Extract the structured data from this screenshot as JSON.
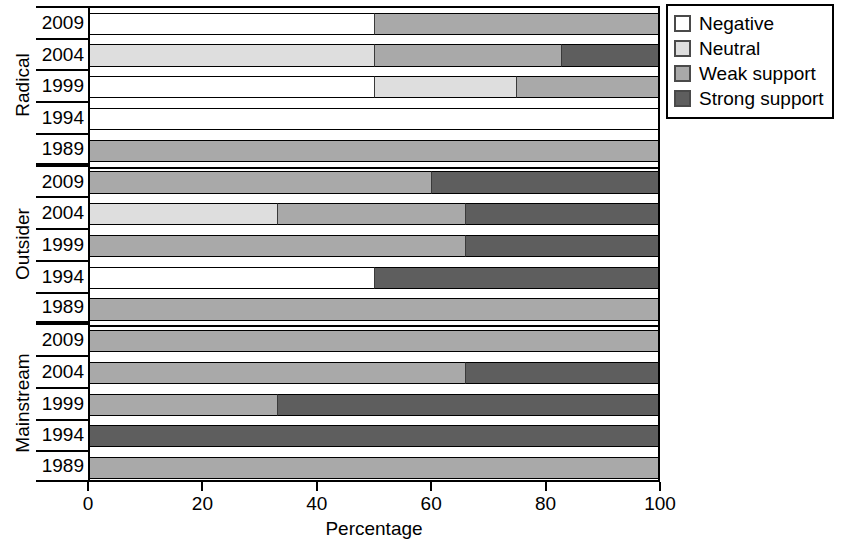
{
  "chart_data": {
    "type": "bar",
    "orientation": "horizontal",
    "stacked": true,
    "stack_mode": "percent",
    "title": "",
    "xlabel": "Percentage",
    "ylabel": "",
    "xlim": [
      0,
      100
    ],
    "xticks": [
      0,
      20,
      40,
      60,
      80,
      100
    ],
    "xticklabels": [
      "0",
      "20",
      "40",
      "60",
      "80",
      "100"
    ],
    "grid": false,
    "legend_position": "top-right",
    "series": [
      {
        "name": "Negative",
        "color": "#ffffff"
      },
      {
        "name": "Neutral",
        "color": "#dedede"
      },
      {
        "name": "Weak support",
        "color": "#a9a9a9"
      },
      {
        "name": "Strong support",
        "color": "#5e5e5e"
      }
    ],
    "groups": [
      {
        "name": "Radical",
        "categories": [
          "2009",
          "2004",
          "1999",
          "1994",
          "1989"
        ],
        "rows": [
          {
            "category": "2009",
            "values": {
              "Negative": 50,
              "Neutral": 0,
              "Weak support": 50,
              "Strong support": 0
            }
          },
          {
            "category": "2004",
            "values": {
              "Negative": 0,
              "Neutral": 50,
              "Weak support": 33,
              "Strong support": 17
            }
          },
          {
            "category": "1999",
            "values": {
              "Negative": 50,
              "Neutral": 25,
              "Weak support": 25,
              "Strong support": 0
            }
          },
          {
            "category": "1994",
            "values": {
              "Negative": 100,
              "Neutral": 0,
              "Weak support": 0,
              "Strong support": 0
            }
          },
          {
            "category": "1989",
            "values": {
              "Negative": 0,
              "Neutral": 0,
              "Weak support": 100,
              "Strong support": 0
            }
          }
        ]
      },
      {
        "name": "Outsider",
        "categories": [
          "2009",
          "2004",
          "1999",
          "1994",
          "1989"
        ],
        "rows": [
          {
            "category": "2009",
            "values": {
              "Negative": 0,
              "Neutral": 0,
              "Weak support": 60,
              "Strong support": 40
            }
          },
          {
            "category": "2004",
            "values": {
              "Negative": 0,
              "Neutral": 33,
              "Weak support": 33,
              "Strong support": 34
            }
          },
          {
            "category": "1999",
            "values": {
              "Negative": 0,
              "Neutral": 0,
              "Weak support": 66,
              "Strong support": 34
            }
          },
          {
            "category": "1994",
            "values": {
              "Negative": 50,
              "Neutral": 0,
              "Weak support": 0,
              "Strong support": 50
            }
          },
          {
            "category": "1989",
            "values": {
              "Negative": 0,
              "Neutral": 0,
              "Weak support": 100,
              "Strong support": 0
            }
          }
        ]
      },
      {
        "name": "Mainstream",
        "categories": [
          "2009",
          "2004",
          "1999",
          "1994",
          "1989"
        ],
        "rows": [
          {
            "category": "2009",
            "values": {
              "Negative": 0,
              "Neutral": 0,
              "Weak support": 100,
              "Strong support": 0
            }
          },
          {
            "category": "2004",
            "values": {
              "Negative": 0,
              "Neutral": 0,
              "Weak support": 66,
              "Strong support": 34
            }
          },
          {
            "category": "1999",
            "values": {
              "Negative": 0,
              "Neutral": 0,
              "Weak support": 33,
              "Strong support": 67
            }
          },
          {
            "category": "1994",
            "values": {
              "Negative": 0,
              "Neutral": 0,
              "Weak support": 0,
              "Strong support": 100
            }
          },
          {
            "category": "1989",
            "values": {
              "Negative": 0,
              "Neutral": 0,
              "Weak support": 100,
              "Strong support": 0
            }
          }
        ]
      }
    ]
  },
  "legend": {
    "items": [
      {
        "label": "Negative",
        "color": "#ffffff"
      },
      {
        "label": "Neutral",
        "color": "#dedede"
      },
      {
        "label": "Weak support",
        "color": "#a9a9a9"
      },
      {
        "label": "Strong support",
        "color": "#5e5e5e"
      }
    ]
  },
  "axes": {
    "x_title": "Percentage",
    "x_ticklabels": [
      "0",
      "20",
      "40",
      "60",
      "80",
      "100"
    ]
  }
}
